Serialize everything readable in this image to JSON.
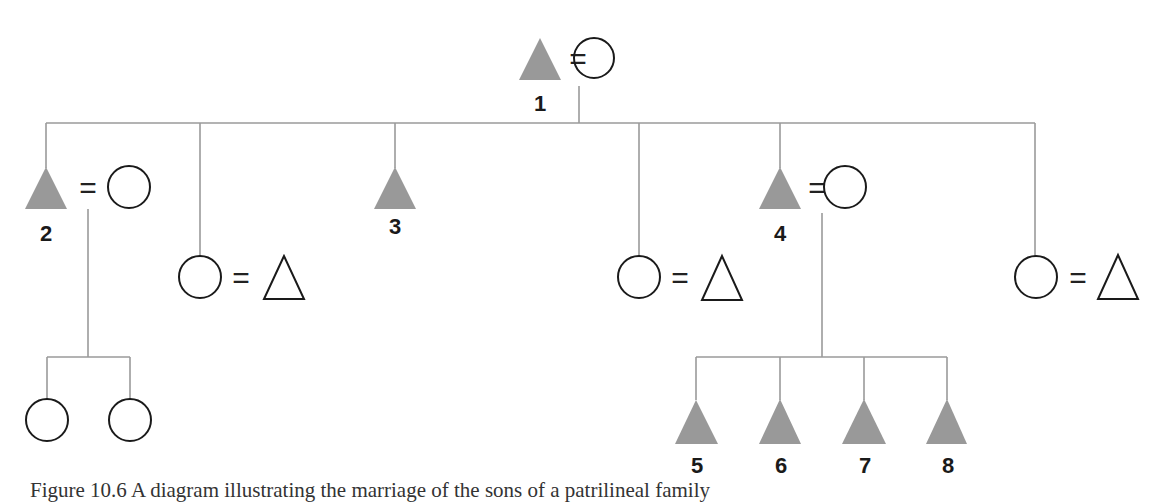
{
  "diagram": {
    "type": "kinship-chart",
    "colors": {
      "line": "#9a9a9a",
      "filled_male": "#999999",
      "outline": "#1a1a1a",
      "label": "#1a1a1a"
    },
    "symbols": {
      "filled_triangle": "male (ego lineage)",
      "open_triangle": "male (in-married)",
      "circle": "female",
      "equals": "marriage"
    },
    "labels": {
      "n1": "1",
      "n2": "2",
      "n3": "3",
      "n4": "4",
      "n5": "5",
      "n6": "6",
      "n7": "7",
      "n8": "8"
    },
    "equals_sign": "=",
    "generations": [
      {
        "level": 1,
        "nodes": [
          {
            "id": "1",
            "symbol": "filled_triangle",
            "spouse": "circle"
          }
        ]
      },
      {
        "level": 2,
        "nodes": [
          {
            "id": "2",
            "symbol": "filled_triangle",
            "spouse": "circle"
          },
          {
            "id": null,
            "symbol": "circle",
            "spouse": "open_triangle"
          },
          {
            "id": "3",
            "symbol": "filled_triangle",
            "spouse": null
          },
          {
            "id": null,
            "symbol": "circle",
            "spouse": "open_triangle"
          },
          {
            "id": "4",
            "symbol": "filled_triangle",
            "spouse": "circle"
          },
          {
            "id": null,
            "symbol": "circle",
            "spouse": "open_triangle"
          }
        ]
      },
      {
        "level": 3,
        "nodes": [
          {
            "parent": "2",
            "symbol": "circle"
          },
          {
            "parent": "2",
            "symbol": "circle"
          },
          {
            "parent": "4",
            "id": "5",
            "symbol": "filled_triangle"
          },
          {
            "parent": "4",
            "id": "6",
            "symbol": "filled_triangle"
          },
          {
            "parent": "4",
            "id": "7",
            "symbol": "filled_triangle"
          },
          {
            "parent": "4",
            "id": "8",
            "symbol": "filled_triangle"
          }
        ]
      }
    ]
  },
  "caption": "Figure 10.6 A diagram illustrating the marriage of the sons of a patrilineal family"
}
